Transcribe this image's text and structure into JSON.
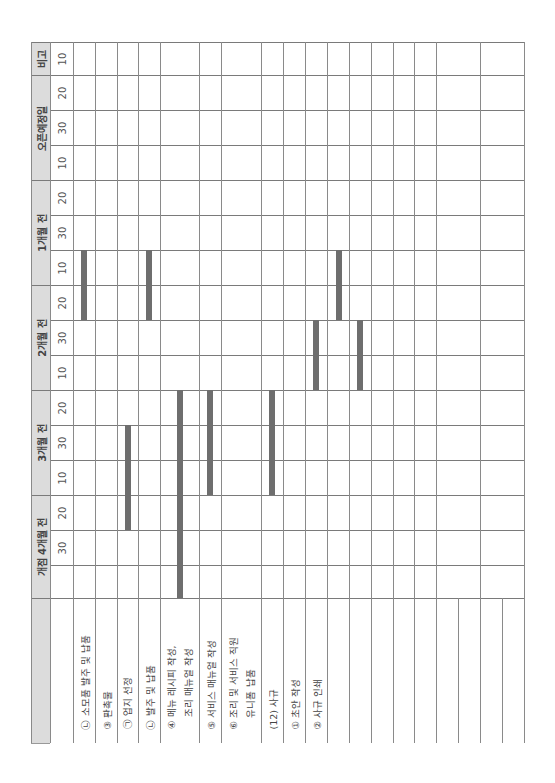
{
  "header": {
    "remarks": "비고",
    "periods": [
      {
        "label": "오픈예정일",
        "y_top": 75,
        "y_bottom": 180
      },
      {
        "label": "1개월 전",
        "y_top": 180,
        "y_bottom": 285
      },
      {
        "label": "2개월 전",
        "y_top": 285,
        "y_bottom": 390
      },
      {
        "label": "3개월 전",
        "y_top": 390,
        "y_bottom": 495
      },
      {
        "label": "개점 4개월 전",
        "y_top": 495,
        "y_bottom": 598
      }
    ]
  },
  "days": [
    {
      "label": "10",
      "y_top": 42,
      "y_bottom": 75
    },
    {
      "label": "20",
      "y_top": 75,
      "y_bottom": 110
    },
    {
      "label": "30",
      "y_top": 110,
      "y_bottom": 145
    },
    {
      "label": "10",
      "y_top": 145,
      "y_bottom": 180
    },
    {
      "label": "20",
      "y_top": 180,
      "y_bottom": 215
    },
    {
      "label": "30",
      "y_top": 215,
      "y_bottom": 250
    },
    {
      "label": "10",
      "y_top": 250,
      "y_bottom": 285
    },
    {
      "label": "20",
      "y_top": 285,
      "y_bottom": 320
    },
    {
      "label": "30",
      "y_top": 320,
      "y_bottom": 355
    },
    {
      "label": "10",
      "y_top": 355,
      "y_bottom": 390
    },
    {
      "label": "20",
      "y_top": 390,
      "y_bottom": 425
    },
    {
      "label": "30",
      "y_top": 425,
      "y_bottom": 460
    },
    {
      "label": "10",
      "y_top": 460,
      "y_bottom": 495
    },
    {
      "label": "20",
      "y_top": 495,
      "y_bottom": 530
    },
    {
      "label": "30",
      "y_top": 530,
      "y_bottom": 565
    }
  ],
  "tasks": [
    {
      "label": "㉡ 소모품 발주 및 납품",
      "x": 73,
      "w": 22
    },
    {
      "label": "③ 판촉물",
      "x": 95,
      "w": 22
    },
    {
      "label": "㉠ 업지 선정",
      "x": 117,
      "w": 21
    },
    {
      "label": "㉡ 발주 및 납품",
      "x": 138,
      "w": 22
    },
    {
      "label": "④ 메뉴 레시피 작성,\n조리 매뉴얼 작성",
      "x": 160,
      "w": 39
    },
    {
      "label": "⑤ 서비스 매뉴얼 작성",
      "x": 199,
      "w": 22
    },
    {
      "label": "⑥ 조리 및 서비스 직원\n유니폼 납품",
      "x": 221,
      "w": 40
    },
    {
      "label": "(12) 사규",
      "x": 261,
      "w": 22
    },
    {
      "label": "① 초안 작성",
      "x": 283,
      "w": 22
    },
    {
      "label": "② 사규 인쇄",
      "x": 305,
      "w": 22
    },
    {
      "label": "",
      "x": 327,
      "w": 22
    },
    {
      "label": "",
      "x": 349,
      "w": 22
    },
    {
      "label": "",
      "x": 371,
      "w": 22
    },
    {
      "label": "",
      "x": 393,
      "w": 21
    },
    {
      "label": "",
      "x": 414,
      "w": 22
    },
    {
      "label": "",
      "x": 436,
      "w": 22
    },
    {
      "label": "",
      "x": 458,
      "w": 22
    },
    {
      "label": "",
      "x": 480,
      "w": 22
    },
    {
      "label": "",
      "x": 502,
      "w": 22
    }
  ],
  "bars": [
    {
      "task": "㉡ 소모품 발주 및 납품",
      "x": 81,
      "y_top": 250,
      "y_bottom": 320,
      "span": "1개월 전 30 ~ 2개월 전 20"
    },
    {
      "task": "㉡ 발주 및 납품",
      "x": 146,
      "y_top": 250,
      "y_bottom": 320,
      "span": "1개월 전 30 ~ 2개월 전 20"
    },
    {
      "task": "㉠ 업지 선정",
      "x": 125,
      "y_top": 425,
      "y_bottom": 530,
      "span": "3개월 전 30 ~ 개점 4개월 전 20"
    },
    {
      "task": "④ 메뉴 레시피 작성, 조리 매뉴얼 작성",
      "x": 177,
      "y_top": 390,
      "y_bottom": 598,
      "span": "3개월 전 10 ~ 개점 4개월 전 이전"
    },
    {
      "task": "⑤ 서비스 매뉴얼 작성",
      "x": 207,
      "y_top": 390,
      "y_bottom": 495,
      "span": "3개월 전 10 ~ 3개월 전 10"
    },
    {
      "task": "(12) 사규",
      "x": 269,
      "y_top": 390,
      "y_bottom": 495,
      "span": "3개월 전 10 ~ 3개월 전 10"
    },
    {
      "task": "① 초안 작성",
      "x": 313,
      "y_top": 320,
      "y_bottom": 390,
      "span": "2개월 전 30 ~ 2개월 전 10"
    },
    {
      "task": "② 사규 인쇄",
      "x": 336,
      "y_top": 250,
      "y_bottom": 320,
      "span": "1개월 전 30 ~ 2개월 전 20"
    },
    {
      "task": "extra",
      "x": 357,
      "y_top": 320,
      "y_bottom": 390,
      "span": "2개월 전 30 ~ 2개월 전 10"
    }
  ],
  "colors": {
    "header_band": "#dcdcdc",
    "bar": "#6e6e6e",
    "grid": "#7a7a7a"
  }
}
